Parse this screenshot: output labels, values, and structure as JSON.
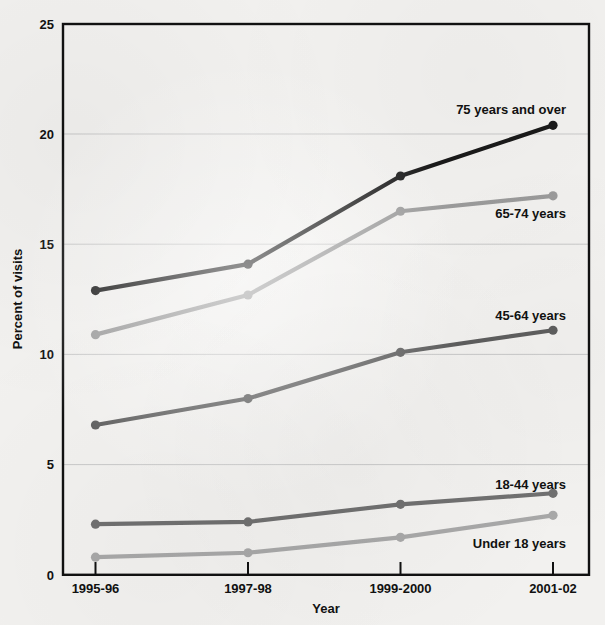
{
  "chart_data": {
    "type": "line",
    "title": "",
    "xlabel": "Year",
    "ylabel": "Percent of visits",
    "categories": [
      "1995-96",
      "1997-98",
      "1999-2000",
      "2001-02"
    ],
    "ylim": [
      0,
      25
    ],
    "ytick_values": [
      0,
      5,
      10,
      15,
      20,
      25
    ],
    "ytick_labels": [
      "0",
      "5",
      "10",
      "15",
      "20",
      "25"
    ],
    "grid": "horizontal",
    "legend_position": "inline-right-of-line",
    "series": [
      {
        "name": "75 years and over",
        "color": "#1a1a1a",
        "values": [
          12.9,
          14.1,
          18.1,
          20.4
        ],
        "label_anchor": "end",
        "label_x": 566,
        "label_y": 114
      },
      {
        "name": "65-74 years",
        "color": "#9b9b9b",
        "values": [
          10.9,
          12.7,
          16.5,
          17.2
        ],
        "label_anchor": "end",
        "label_x": 566,
        "label_y": 218
      },
      {
        "name": "45-64 years",
        "color": "#5e5e5e",
        "values": [
          6.8,
          8.0,
          10.1,
          11.1
        ],
        "label_anchor": "end",
        "label_x": 566,
        "label_y": 320
      },
      {
        "name": "18-44 years",
        "color": "#707070",
        "values": [
          2.3,
          2.4,
          3.2,
          3.7
        ],
        "label_anchor": "end",
        "label_x": 566,
        "label_y": 489
      },
      {
        "name": "Under 18 years",
        "color": "#a8a8a8",
        "values": [
          0.8,
          1.0,
          1.7,
          2.7
        ],
        "label_anchor": "end",
        "label_x": 566,
        "label_y": 548
      }
    ]
  },
  "axis": {
    "y_tick_0": "0",
    "y_tick_5": "5",
    "y_tick_10": "10",
    "y_tick_15": "15",
    "y_tick_20": "20",
    "y_tick_25": "25",
    "y_title": "Percent of visits",
    "x_title": "Year",
    "x_tick_1": "1995-96",
    "x_tick_2": "1997-98",
    "x_tick_3": "1999-2000",
    "x_tick_4": "2001-02"
  },
  "series_labels": {
    "s75": "75 years and over",
    "s65": "65-74 years",
    "s45": "45-64 years",
    "s18": "18-44 years",
    "sunder": "Under 18 years"
  }
}
